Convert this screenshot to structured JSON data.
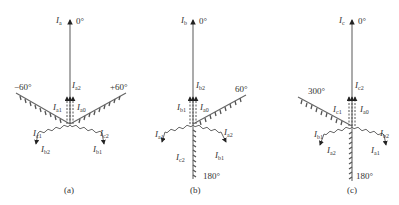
{
  "figure": {
    "panels": [
      {
        "id": "a",
        "caption": "(a)",
        "reference_phasor": {
          "label": "I",
          "sub": "a",
          "angle": "0°"
        },
        "hatched_axes": [
          {
            "angle_label": "−60°"
          },
          {
            "angle_label": "+60°"
          }
        ],
        "upward_components": [
          {
            "label": "I",
            "sub": "a2"
          },
          {
            "label": "I",
            "sub": "a1"
          },
          {
            "label": "I",
            "sub": "a0"
          }
        ],
        "lower_left_components": [
          {
            "label": "I",
            "sub": "c1"
          },
          {
            "label": "I",
            "sub": "b2"
          }
        ],
        "lower_right_components": [
          {
            "label": "I",
            "sub": "c2"
          },
          {
            "label": "I",
            "sub": "b1"
          }
        ]
      },
      {
        "id": "b",
        "caption": "(b)",
        "reference_phasor": {
          "label": "I",
          "sub": "b",
          "angle": "0°"
        },
        "hatched_axes": [
          {
            "angle_label": "60°"
          },
          {
            "angle_label": "180°"
          }
        ],
        "upward_components": [
          {
            "label": "I",
            "sub": "b2"
          },
          {
            "label": "I",
            "sub": "b1"
          },
          {
            "label": "I",
            "sub": "a0"
          }
        ],
        "lower_left_components": [
          {
            "label": "I",
            "sub": "a1"
          },
          {
            "label": "I",
            "sub": "c2"
          }
        ],
        "lower_right_components": [
          {
            "label": "I",
            "sub": "a2"
          },
          {
            "label": "I",
            "sub": "b1"
          }
        ]
      },
      {
        "id": "c",
        "caption": "(c)",
        "reference_phasor": {
          "label": "I",
          "sub": "c",
          "angle": "0°"
        },
        "hatched_axes": [
          {
            "angle_label": "300°"
          },
          {
            "angle_label": "180°"
          }
        ],
        "upward_components": [
          {
            "label": "I",
            "sub": "c2"
          },
          {
            "label": "I",
            "sub": "c1"
          },
          {
            "label": "I",
            "sub": "a0"
          }
        ],
        "lower_left_components": [
          {
            "label": "I",
            "sub": "b1"
          },
          {
            "label": "I",
            "sub": "a2"
          }
        ],
        "lower_right_components": [
          {
            "label": "I",
            "sub": "b2"
          },
          {
            "label": "I",
            "sub": "a1"
          }
        ]
      }
    ]
  }
}
